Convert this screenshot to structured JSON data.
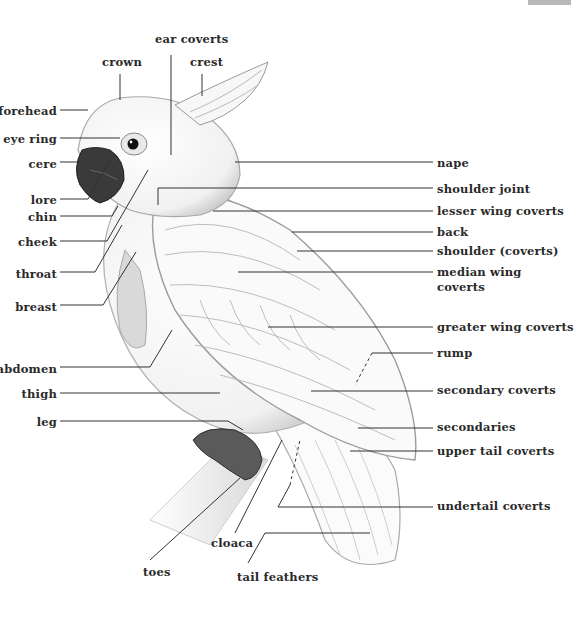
{
  "diagram": {
    "colors": {
      "text": "#2a2a2a",
      "lines": "#333333",
      "beak": "#3a3a3a",
      "corner_tab": "#b8b8b8"
    },
    "labels_top": [
      {
        "id": "ear-coverts",
        "text": "ear coverts",
        "x": 155,
        "y": 32
      },
      {
        "id": "crown",
        "text": "crown",
        "x": 102,
        "y": 55
      },
      {
        "id": "crest",
        "text": "crest",
        "x": 190,
        "y": 55
      }
    ],
    "labels_left": [
      {
        "id": "forehead",
        "text": "forehead",
        "right": 57,
        "y": 104
      },
      {
        "id": "eye-ring",
        "text": "eye ring",
        "right": 57,
        "y": 132
      },
      {
        "id": "cere",
        "text": "cere",
        "right": 57,
        "y": 157
      },
      {
        "id": "lore",
        "text": "lore",
        "right": 57,
        "y": 193
      },
      {
        "id": "chin",
        "text": "chin",
        "right": 57,
        "y": 210
      },
      {
        "id": "cheek",
        "text": "cheek",
        "right": 57,
        "y": 235
      },
      {
        "id": "throat",
        "text": "throat",
        "right": 57,
        "y": 267
      },
      {
        "id": "breast",
        "text": "breast",
        "right": 57,
        "y": 300
      },
      {
        "id": "abdomen",
        "text": "abdomen",
        "right": 57,
        "y": 362
      },
      {
        "id": "thigh",
        "text": "thigh",
        "right": 57,
        "y": 387
      },
      {
        "id": "leg",
        "text": "leg",
        "right": 57,
        "y": 415
      }
    ],
    "labels_right": [
      {
        "id": "nape",
        "text": "nape",
        "x": 437,
        "y": 157
      },
      {
        "id": "shoulder-joint",
        "text": "shoulder joint",
        "x": 437,
        "y": 183
      },
      {
        "id": "lesser-wing-coverts",
        "text": "lesser wing coverts",
        "x": 437,
        "y": 204
      },
      {
        "id": "back",
        "text": "back",
        "x": 437,
        "y": 225
      },
      {
        "id": "shoulder-coverts",
        "text": "shoulder (coverts)",
        "x": 437,
        "y": 244
      },
      {
        "id": "median-wing-coverts",
        "text": "median wing",
        "text2": "coverts",
        "x": 437,
        "y": 265
      },
      {
        "id": "greater-wing-coverts",
        "text": "greater wing coverts",
        "x": 437,
        "y": 320
      },
      {
        "id": "rump",
        "text": "rump",
        "x": 437,
        "y": 346
      },
      {
        "id": "secondary-coverts",
        "text": "secondary coverts",
        "x": 437,
        "y": 383
      },
      {
        "id": "secondaries",
        "text": "secondaries",
        "x": 437,
        "y": 420
      },
      {
        "id": "upper-tail-coverts",
        "text": "upper tail coverts",
        "x": 437,
        "y": 444
      },
      {
        "id": "undertail-coverts",
        "text": "undertail coverts",
        "x": 437,
        "y": 499
      }
    ],
    "labels_bottom": [
      {
        "id": "cloaca",
        "text": "cloaca",
        "x": 211,
        "y": 536
      },
      {
        "id": "toes",
        "text": "toes",
        "x": 143,
        "y": 565
      },
      {
        "id": "tail-feathers",
        "text": "tail feathers",
        "x": 237,
        "y": 570
      }
    ]
  }
}
